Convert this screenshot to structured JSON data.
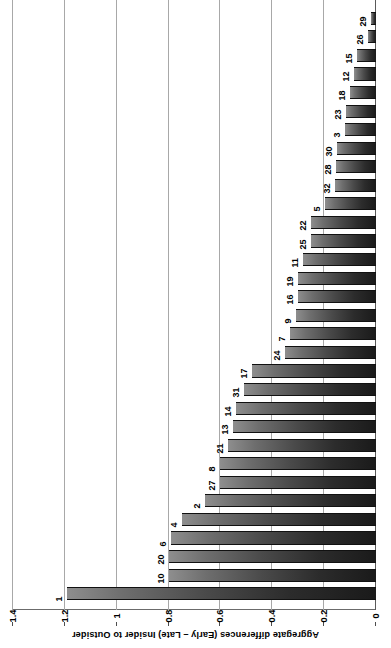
{
  "chart_data": {
    "type": "bar",
    "orientation": "horizontal",
    "title": "",
    "xlabel": "Aggregate differences (Early – Late) Insider to Outsider",
    "ylabel": "",
    "xlim": [
      0,
      1.4
    ],
    "grid": true,
    "legend": "none",
    "xticks": [
      "0",
      "0.2",
      "0.4",
      "0.6",
      "0.8",
      "1",
      "1.2",
      "1.4"
    ],
    "xtick_values": [
      0,
      0.2,
      0.4,
      0.6,
      0.8,
      1.0,
      1.2,
      1.4
    ],
    "categories": [
      "1",
      "10",
      "20",
      "6",
      "4",
      "2",
      "27",
      "8",
      "21",
      "13",
      "14",
      "31",
      "17",
      "24",
      "7",
      "9",
      "16",
      "19",
      "11",
      "25",
      "22",
      "5",
      "32",
      "28",
      "30",
      "3",
      "23",
      "18",
      "12",
      "15",
      "26",
      "29"
    ],
    "values": [
      1.19,
      0.8,
      0.8,
      0.79,
      0.75,
      0.66,
      0.6,
      0.6,
      0.57,
      0.55,
      0.54,
      0.51,
      0.48,
      0.35,
      0.33,
      0.31,
      0.3,
      0.3,
      0.28,
      0.25,
      0.25,
      0.195,
      0.16,
      0.155,
      0.15,
      0.12,
      0.115,
      0.1,
      0.085,
      0.075,
      0.03,
      0.02
    ]
  },
  "axis": {
    "value_axis_title": "Aggregate differences (Early – Late) Insider to Outsider"
  }
}
